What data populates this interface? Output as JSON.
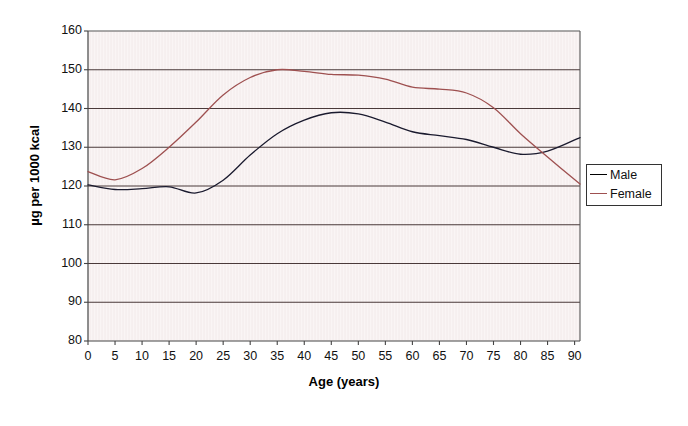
{
  "chart_data": {
    "type": "line",
    "title": "",
    "xlabel": "Age (years)",
    "ylabel": "µg per 1000 kcal",
    "xlim": [
      0,
      91
    ],
    "ylim": [
      80,
      160
    ],
    "xticks": [
      0,
      5,
      10,
      15,
      20,
      25,
      30,
      35,
      40,
      45,
      50,
      55,
      60,
      65,
      70,
      75,
      80,
      85,
      90
    ],
    "yticks": [
      80,
      90,
      100,
      110,
      120,
      130,
      140,
      150,
      160
    ],
    "xtick_labels": [
      "0",
      "5",
      "10",
      "15",
      "20",
      "25",
      "30",
      "35",
      "40",
      "45",
      "50",
      "55",
      "60",
      "65",
      "70",
      "75",
      "80",
      "85",
      "90"
    ],
    "ytick_labels": [
      "80",
      "90",
      "100",
      "110",
      "120",
      "130",
      "140",
      "150",
      "160"
    ],
    "grid": "horizontal",
    "legend_position": "right",
    "plot_bgcolor": "#faf5f5",
    "gridline_color": "#4a3a3a",
    "axis_color": "#444444",
    "x": [
      0,
      5,
      10,
      15,
      20,
      25,
      30,
      35,
      40,
      45,
      50,
      55,
      60,
      65,
      70,
      75,
      80,
      85,
      91
    ],
    "series": [
      {
        "name": "Male",
        "color": "#1a1a2e",
        "values": [
          120.3,
          119.1,
          119.3,
          119.8,
          118.2,
          121.5,
          128.0,
          133.5,
          137.0,
          138.9,
          138.6,
          136.5,
          134.0,
          133.0,
          132.0,
          130.0,
          128.2,
          129.0,
          132.5
        ]
      },
      {
        "name": "Female",
        "color": "#9e5050",
        "values": [
          123.7,
          121.6,
          124.5,
          130.0,
          136.5,
          143.5,
          148.0,
          150.0,
          149.6,
          148.8,
          148.6,
          147.6,
          145.5,
          145.0,
          144.0,
          140.2,
          133.5,
          127.5,
          120.5
        ]
      }
    ]
  },
  "legend": {
    "items": [
      {
        "label": "Male"
      },
      {
        "label": "Female"
      }
    ]
  }
}
